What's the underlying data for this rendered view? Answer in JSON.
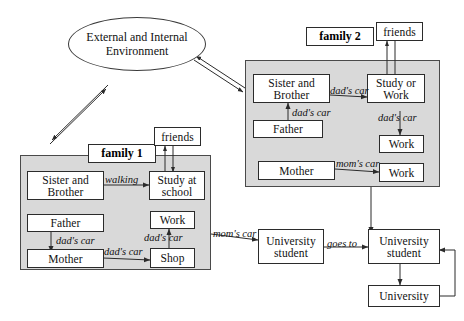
{
  "diagram": {
    "title_node": {
      "label": "External and Internal Environment"
    },
    "panels": {
      "family1": {
        "title": "family 1"
      },
      "family2": {
        "title": "family 2"
      }
    },
    "family1_nodes": {
      "sister_brother": "Sister and Brother",
      "study_at_school": "Study at school",
      "father": "Father",
      "work": "Work",
      "mother": "Mother",
      "shop": "Shop",
      "friends": "friends"
    },
    "family1_labels": {
      "walking": "walking",
      "father_to_mother": "dad's car",
      "shop_to_work": "dad's car",
      "mother_to_shop": "dad's car"
    },
    "family2_nodes": {
      "sister_brother": "Sister and Brother",
      "study_or_work": "Study or Work",
      "father": "Father",
      "work_right": "Work",
      "mother": "Mother",
      "work_bottom": "Work",
      "friends": "friends"
    },
    "family2_labels": {
      "sb_to_study": "dad's car",
      "father_to_sb": "dad's car",
      "study_to_work": "dad's car",
      "mother_to_work": "mom's car"
    },
    "outer_nodes": {
      "university_student_left": "University student",
      "university_student_right": "University student",
      "university": "University"
    },
    "outer_labels": {
      "moms_car": "mom's car",
      "goes_to": "goes to"
    },
    "colors": {
      "panel_fill": "#d9d9d9",
      "node_fill": "#ffffff",
      "stroke": "#2b2b2b",
      "background": "#ffffff"
    }
  }
}
